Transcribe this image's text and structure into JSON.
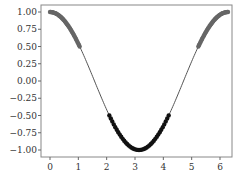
{
  "chart_data": {
    "type": "line",
    "title": "",
    "xlabel": "",
    "ylabel": "",
    "xlim": [
      -0.3,
      6.6
    ],
    "ylim": [
      -1.1,
      1.1
    ],
    "x_ticks": [
      0,
      1,
      2,
      3,
      4,
      5,
      6
    ],
    "x_tick_labels": [
      "0",
      "1",
      "2",
      "3",
      "4",
      "5",
      "6"
    ],
    "y_ticks": [
      1.0,
      0.75,
      0.5,
      0.25,
      0.0,
      -0.25,
      -0.5,
      -0.75,
      -1.0
    ],
    "y_tick_labels": [
      "1.00",
      "0.75",
      "0.50",
      "0.25",
      "0.00",
      "-0.25",
      "-0.50",
      "-0.75",
      "-1.00"
    ],
    "grid": false,
    "series": [
      {
        "name": "cos(x)",
        "function": "cos",
        "x_range": [
          0,
          6.283
        ],
        "style": "line",
        "color": "#555555"
      },
      {
        "name": "cos(x) >= 0.5",
        "style": "markers",
        "color": "#666666",
        "x_ranges": [
          [
            0,
            1.047
          ],
          [
            5.236,
            6.283
          ]
        ]
      },
      {
        "name": "cos(x) <= -0.5",
        "style": "markers",
        "color": "#111111",
        "x_ranges": [
          [
            2.094,
            4.189
          ]
        ]
      }
    ]
  },
  "axes": {
    "frame": {
      "left": 41,
      "top": 5,
      "right": 232,
      "bottom": 157
    }
  }
}
